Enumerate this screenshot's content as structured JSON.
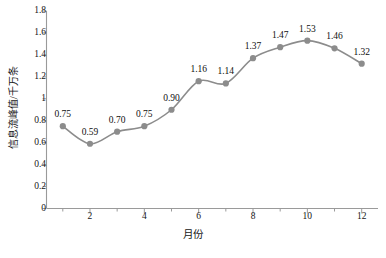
{
  "chart_data": {
    "type": "line",
    "title": "",
    "subtitle": "",
    "xlabel": "月份",
    "ylabel": "信息流峰值/千万条",
    "x": [
      1,
      2,
      3,
      4,
      5,
      6,
      7,
      8,
      9,
      10,
      11,
      12
    ],
    "categories": [
      "1",
      "2",
      "3",
      "4",
      "5",
      "6",
      "7",
      "8",
      "9",
      "10",
      "11",
      "12"
    ],
    "values": [
      0.75,
      0.59,
      0.7,
      0.75,
      0.9,
      1.16,
      1.14,
      1.37,
      1.47,
      1.53,
      1.46,
      1.32
    ],
    "point_labels": [
      "0.75",
      "0.59",
      "0.70",
      "0.75",
      "0.90",
      "1.16",
      "1.14",
      "1.37",
      "1.47",
      "1.53",
      "1.46",
      "1.32"
    ],
    "series": [
      {
        "name": "信息流峰值",
        "values": [
          0.75,
          0.59,
          0.7,
          0.75,
          0.9,
          1.16,
          1.14,
          1.37,
          1.47,
          1.53,
          1.46,
          1.32
        ],
        "color": "#8c8c8c"
      }
    ],
    "xlim": [
      0.4,
      12.6
    ],
    "ylim": [
      0,
      1.8
    ],
    "xticks": [
      2,
      4,
      6,
      8,
      10,
      12
    ],
    "xtick_labels": [
      "2",
      "4",
      "6",
      "8",
      "10",
      "12"
    ],
    "xminor_ticks": [
      1,
      3,
      5,
      7,
      9,
      11
    ],
    "yticks": [
      0,
      0.2,
      0.4,
      0.6,
      0.8,
      1.0,
      1.2,
      1.4,
      1.6,
      1.8
    ],
    "ytick_labels": [
      "0",
      "0.2",
      "0.4",
      "0.6",
      "0.8",
      "1",
      "1.2",
      "1.4",
      "1.6",
      "1.8"
    ],
    "grid": false,
    "legend": false,
    "legend_position": "none",
    "line_color": "#8c8c8c",
    "marker_color": "#8c8c8c",
    "marker_shape": "circle",
    "axis_color": "#9a9a9a",
    "data_labels_shown": true
  },
  "caption": {
    "text": ""
  }
}
